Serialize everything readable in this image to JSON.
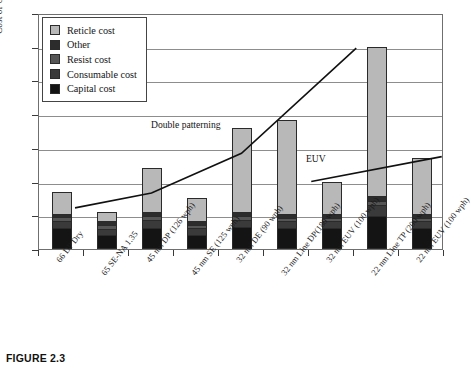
{
  "caption": "FIGURE 2.3",
  "chart_data": {
    "type": "bar",
    "title": "",
    "xlabel": "",
    "ylabel": "Cost of Ownership for 5000 Wafers per Mask",
    "stacked": true,
    "grid": true,
    "ylim": [
      0,
      7
    ],
    "y_tick_count": 7,
    "y_tick_labels": [],
    "legend_position": "top-left",
    "legend": [
      "Reticle cost",
      "Other",
      "Resist cost",
      "Consumable cost",
      "Capital cost"
    ],
    "series": [
      {
        "name": "Capital cost",
        "key": "capital",
        "color": "#141414",
        "values": [
          0.62,
          0.4,
          0.62,
          0.4,
          0.62,
          0.6,
          0.6,
          0.95,
          0.6
        ]
      },
      {
        "name": "Consumable cost",
        "key": "consum",
        "color": "#3a3a3a",
        "values": [
          0.22,
          0.18,
          0.22,
          0.22,
          0.22,
          0.2,
          0.22,
          0.35,
          0.22
        ]
      },
      {
        "name": "Resist cost",
        "key": "resist",
        "color": "#555555",
        "values": [
          0.1,
          0.14,
          0.12,
          0.1,
          0.12,
          0.1,
          0.1,
          0.12,
          0.1
        ]
      },
      {
        "name": "Other",
        "key": "other",
        "color": "#2c2c2c",
        "values": [
          0.12,
          0.12,
          0.14,
          0.12,
          0.14,
          0.12,
          0.12,
          0.14,
          0.12
        ]
      },
      {
        "name": "Reticle cost",
        "key": "reticle",
        "color": "#b8b8b8",
        "values": [
          0.64,
          0.26,
          1.3,
          0.66,
          2.5,
          2.8,
          0.96,
          4.44,
          1.66
        ]
      }
    ],
    "categories": [
      "66 DP Dry",
      "65 SE-NA 1.35",
      "45 nm DP (126 wph)",
      "45 nm SE (125 wph)",
      "32 nm DE (90 wph)",
      "32 nm Line DP(180 wph)",
      "32 nm EUV (100 wph)",
      "22 nm Line TP (200 wph)",
      "22 nm EUV (100 wph)"
    ],
    "totals": [
      1.7,
      1.1,
      2.4,
      1.5,
      3.6,
      3.82,
      2.0,
      6.0,
      2.7
    ],
    "annotations": [
      {
        "text": "Double patterning",
        "x": 150,
        "y": 118
      },
      {
        "text": "EUV",
        "x": 305,
        "y": 152
      }
    ],
    "trend_lines": [
      {
        "name": "Double patterning",
        "points": [
          [
            0.3,
            1.28
          ],
          [
            2.0,
            1.72
          ],
          [
            4.0,
            2.9
          ],
          [
            6.55,
            6.02
          ]
        ]
      },
      {
        "name": "EUV",
        "points": [
          [
            5.55,
            2.06
          ],
          [
            8.45,
            2.8
          ]
        ]
      }
    ]
  },
  "legend_items": [
    {
      "label": "Reticle cost",
      "swatch": "#b8b8b8"
    },
    {
      "label": "Other",
      "swatch": "#2c2c2c"
    },
    {
      "label": "Resist cost",
      "swatch": "#555555"
    },
    {
      "label": "Consumable cost",
      "swatch": "#3a3a3a"
    },
    {
      "label": "Capital cost",
      "swatch": "#141414"
    }
  ]
}
